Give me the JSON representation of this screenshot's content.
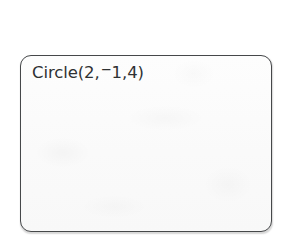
{
  "device": {
    "screen_label": "graphing-calculator-screen"
  },
  "screen": {
    "lines": [
      {
        "command": "Circle(",
        "args_before_negative": "2,",
        "negative_sign": "−",
        "args_after_negative": "1,4)",
        "full_text": "Circle(2,−1,4)"
      }
    ]
  },
  "colors": {
    "page_background": "#ffffff",
    "screen_background": "#fcfcfc",
    "screen_border": "#46484a",
    "text": "#2f3133"
  }
}
